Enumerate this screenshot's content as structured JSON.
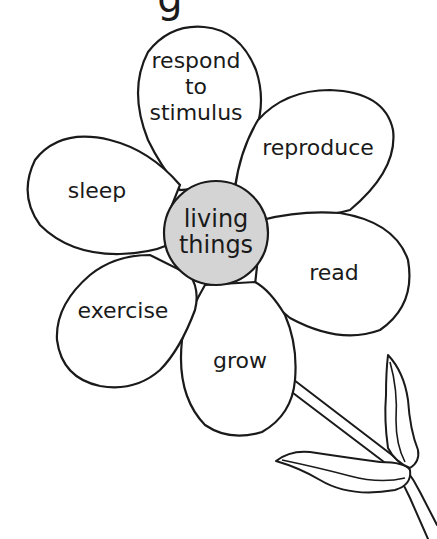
{
  "diagram": {
    "title_fragment": "g",
    "center": {
      "lines": [
        "living",
        "things"
      ],
      "fill_color": "#d4d4d4"
    },
    "petals": [
      {
        "id": "top",
        "lines": [
          "respond",
          "to",
          "stimulus"
        ]
      },
      {
        "id": "upper-right",
        "lines": [
          "reproduce"
        ]
      },
      {
        "id": "right",
        "lines": [
          "read"
        ]
      },
      {
        "id": "bottom",
        "lines": [
          "grow"
        ]
      },
      {
        "id": "lower-left",
        "lines": [
          "exercise"
        ]
      },
      {
        "id": "upper-left",
        "lines": [
          "sleep"
        ]
      }
    ],
    "colors": {
      "outline": "#1a1a1a",
      "background": "#ffffff",
      "petal_fill": "#ffffff"
    }
  }
}
